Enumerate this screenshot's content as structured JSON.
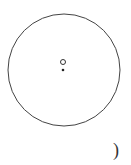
{
  "diagram": {
    "circle": {
      "cx": 64,
      "cy": 70,
      "r": 56,
      "stroke": "#444444"
    },
    "open_point": {
      "cx": 63,
      "cy": 62,
      "r": 2.5,
      "label": ""
    },
    "center_point": {
      "cx": 63,
      "cy": 70,
      "r": 1.3
    },
    "caption": ")"
  }
}
